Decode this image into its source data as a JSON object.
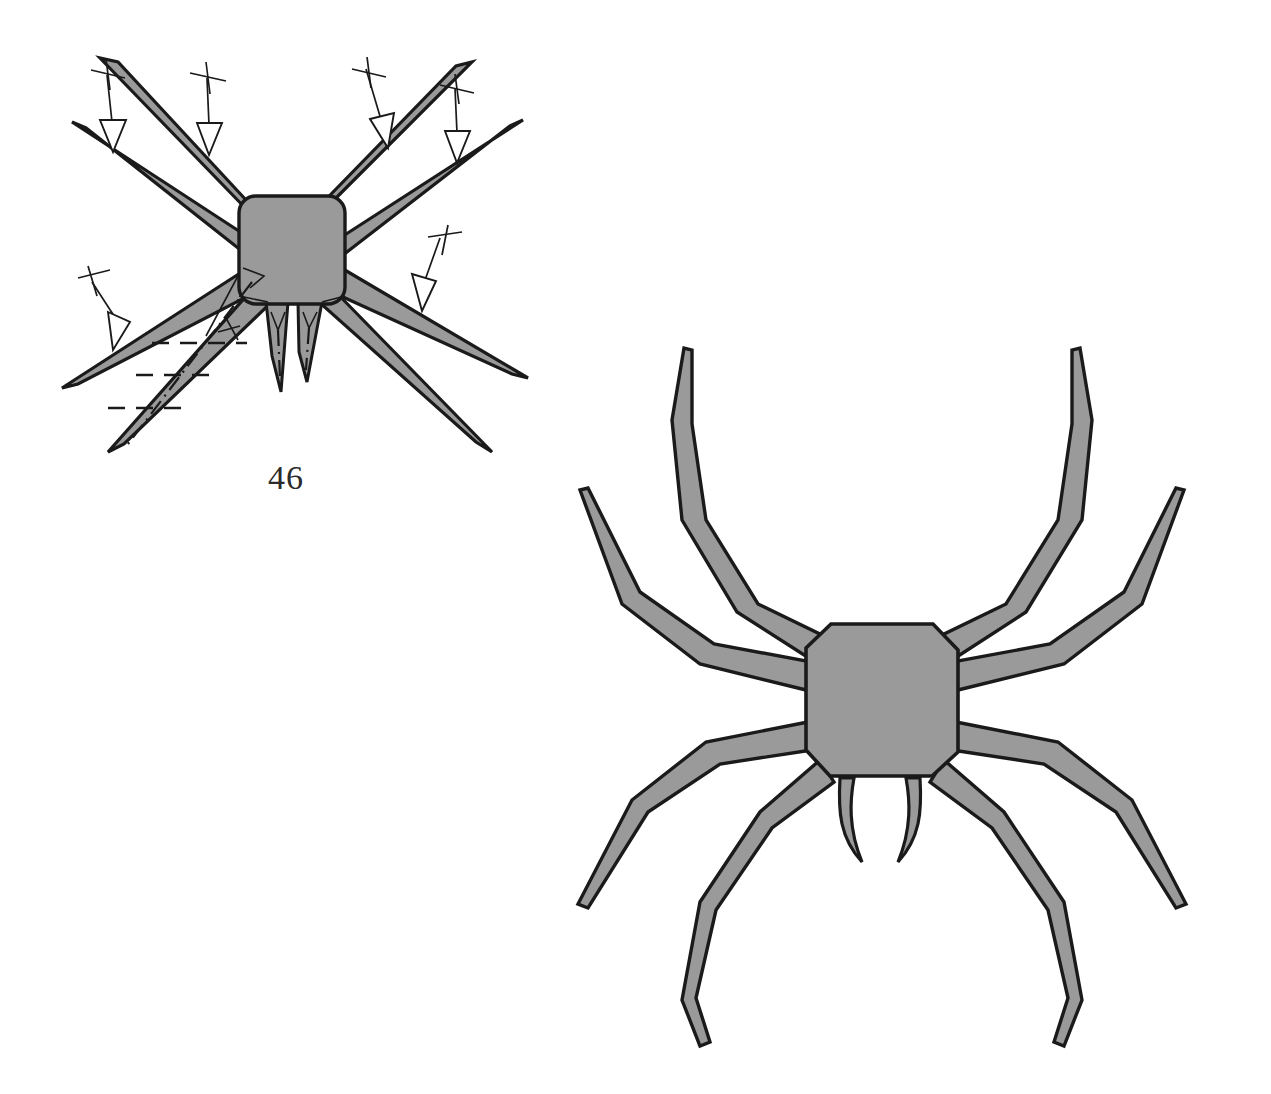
{
  "document": {
    "title": "Origami Spider Folding Diagram",
    "background_color": "#ffffff",
    "paper_fill_color": "#9a9a9a",
    "line_color": "#1a1a1a",
    "width": 1271,
    "height": 1094
  },
  "figures": {
    "step_figure": {
      "name": "step-46-figure",
      "step_number": "46",
      "description": "Flat spider base with eight straight tapered legs radiating from a rounded square body, two pointed fangs below, crimp arrows on six legs and pleat creases on the lower-left leg",
      "body": {
        "shape": "rounded-square",
        "center_x": 292,
        "center_y": 250,
        "half_width": 53,
        "half_height": 54,
        "corner_radius": 16
      },
      "legs": [
        {
          "id": "leg-upper-left-outer",
          "tip_x": 72,
          "tip_y": 122,
          "base_angle_deg": 205,
          "style": "straight-spike"
        },
        {
          "id": "leg-upper-left-inner",
          "tip_x": 100,
          "tip_y": 58,
          "base_angle_deg": 222,
          "style": "straight-spike"
        },
        {
          "id": "leg-upper-right-inner",
          "tip_x": 472,
          "tip_y": 62,
          "base_angle_deg": 318,
          "style": "straight-spike"
        },
        {
          "id": "leg-upper-right-outer",
          "tip_x": 523,
          "tip_y": 120,
          "base_angle_deg": 335,
          "style": "straight-spike"
        },
        {
          "id": "leg-lower-left-outer",
          "tip_x": 62,
          "tip_y": 388,
          "base_angle_deg": 155,
          "style": "straight-spike"
        },
        {
          "id": "leg-lower-left-inner",
          "tip_x": 108,
          "tip_y": 452,
          "base_angle_deg": 132,
          "style": "straight-spike"
        },
        {
          "id": "leg-lower-right-inner",
          "tip_x": 492,
          "tip_y": 452,
          "base_angle_deg": 48,
          "style": "straight-spike"
        },
        {
          "id": "leg-lower-right-outer",
          "tip_x": 528,
          "tip_y": 378,
          "base_angle_deg": 25,
          "style": "straight-spike"
        }
      ],
      "fangs": [
        {
          "id": "fang-left",
          "tip_x": 281,
          "tip_y": 392
        },
        {
          "id": "fang-right",
          "tip_x": 307,
          "tip_y": 382
        }
      ],
      "arrows": [
        {
          "id": "crimp-arrow-1",
          "target_leg": "leg-upper-left-outer",
          "type": "crimp-arrow"
        },
        {
          "id": "crimp-arrow-2",
          "target_leg": "leg-upper-left-inner",
          "type": "crimp-arrow"
        },
        {
          "id": "crimp-arrow-3",
          "target_leg": "leg-upper-right-inner",
          "type": "crimp-arrow"
        },
        {
          "id": "crimp-arrow-4",
          "target_leg": "leg-upper-right-outer",
          "type": "crimp-arrow"
        },
        {
          "id": "crimp-arrow-5",
          "target_leg": "leg-lower-right-outer",
          "type": "crimp-arrow"
        },
        {
          "id": "crimp-arrow-6",
          "target_leg": "leg-lower-left-outer",
          "type": "crimp-arrow"
        }
      ],
      "creases": {
        "valley_folds": 3,
        "mountain_folds": 1,
        "description": "Three short horizontal valley-fold dashes cross the lower-left inner leg; one dash-dot mountain fold runs along its length"
      }
    },
    "result_figure": {
      "name": "finished-spider-figure",
      "description": "Completed origami spider with eight jointed bent legs, rounded octagonal body and two curved fangs",
      "body": {
        "shape": "rounded-octagon",
        "center_x": 882,
        "center_y": 700,
        "half_width": 76,
        "half_height": 78
      },
      "legs": [
        {
          "id": "result-leg-front-left",
          "style": "jointed-bent"
        },
        {
          "id": "result-leg-second-left",
          "style": "jointed-bent"
        },
        {
          "id": "result-leg-third-left",
          "style": "jointed-bent"
        },
        {
          "id": "result-leg-rear-left",
          "style": "jointed-bent"
        },
        {
          "id": "result-leg-front-right",
          "style": "jointed-bent"
        },
        {
          "id": "result-leg-second-right",
          "style": "jointed-bent"
        },
        {
          "id": "result-leg-third-right",
          "style": "jointed-bent"
        },
        {
          "id": "result-leg-rear-right",
          "style": "jointed-bent"
        }
      ],
      "fangs": [
        {
          "id": "result-fang-left"
        },
        {
          "id": "result-fang-right"
        }
      ]
    }
  }
}
